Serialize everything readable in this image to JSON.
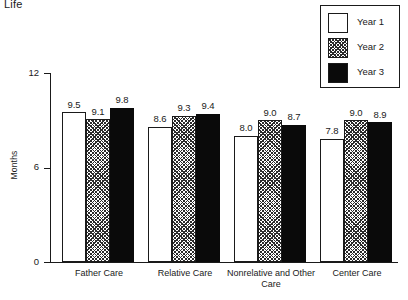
{
  "caption": "Life",
  "legend": {
    "position": "top-right",
    "entries": [
      {
        "label": "Year 1",
        "swatch": "white-square-icon",
        "style": "white"
      },
      {
        "label": "Year 2",
        "swatch": "hatched-square-icon",
        "style": "hatch"
      },
      {
        "label": "Year 3",
        "swatch": "black-square-icon",
        "style": "black"
      }
    ]
  },
  "chart_data": {
    "type": "bar",
    "title": "Life",
    "xlabel": "",
    "ylabel": "Months",
    "ylim": [
      0,
      12
    ],
    "yticks": [
      "0",
      "6",
      "12"
    ],
    "ytick_values": [
      0,
      6,
      12
    ],
    "grid": false,
    "legend_position": "top-right",
    "categories": [
      "Father Care",
      "Relative Care",
      "Nonrelative and Other Care",
      "Center Care"
    ],
    "series": [
      {
        "name": "Year 1",
        "values": [
          9.5,
          8.6,
          8.0,
          7.8
        ],
        "labels": [
          "9.5",
          "8.6",
          "8.0",
          "7.8"
        ]
      },
      {
        "name": "Year 2",
        "values": [
          9.1,
          9.3,
          9.0,
          9.0
        ],
        "labels": [
          "9.1",
          "9.3",
          "9.0",
          "9.0"
        ]
      },
      {
        "name": "Year 3",
        "values": [
          9.8,
          9.4,
          8.7,
          8.9
        ],
        "labels": [
          "9.8",
          "9.4",
          "8.7",
          "8.9"
        ]
      }
    ]
  },
  "colors": {
    "axis": "#1a1a1a",
    "bar_year1": "#ffffff",
    "bar_year2": "#2b2b2b",
    "bar_year3": "#0a0a0a",
    "background": "#ffffff"
  }
}
